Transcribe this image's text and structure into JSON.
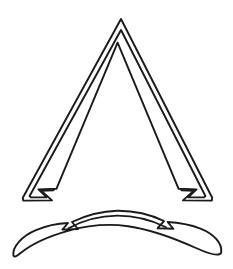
{
  "canvas": {
    "width": 233,
    "height": 269,
    "background_color": "#ffffff",
    "ink_color": "#1a1a1a",
    "stroke_width": 1.9
  },
  "artwork": {
    "title": "Line-art emblem: chevron with banner scroll",
    "style": "black outline on white, no fill",
    "element_count": 2
  },
  "shapes": {
    "chevron": {
      "label": "Double-outlined tall triangle with flared notched feet",
      "apex": {
        "x": 121,
        "y": 19
      },
      "left_foot": {
        "x": 31,
        "y": 200
      },
      "right_foot": {
        "x": 212,
        "y": 200
      },
      "band_thickness": 8,
      "outer_path": "M 121 19 L 212 198 L 211.5 200.5 L 183 200 L 194 190.5 L 182 190 L 117.5 36 L 53 190 L 41 190.5 L 51.5 200 L 23.5 200.5 L 23 198 Z",
      "outer_outline": "M 121.0 19.0 L 212.2 197.8 L 211.8 200.6 L 183.0 200.4 L 193.8 190.8 L 181.6 190.4 L 117.6 36.6 L 53.4 190.4 L 41.2 190.8 L 52.0 200.4 L 23.2 200.6 L 22.8 197.8 Z",
      "inner_outline": "M 121.0 30.0 L 205.4 196.0 L 204.0 197.4 L 188.2 197.2 L 196.6 189.4 L 178.6 188.8 L 117.6 42.6 L 56.4 188.8 L 38.4 189.4 L 46.8 197.2 L 31.0 197.4 L 29.6 196.0 Z"
    },
    "banner": {
      "label": "Curved ribbon scroll with pointed tails",
      "left_tip": {
        "x": 13,
        "y": 256
      },
      "right_tip": {
        "x": 221,
        "y": 253
      },
      "arc_crest": {
        "x": 117,
        "y": 211
      },
      "outer_path": "M 13.4 255.6 C 12.0 247.0 22.0 236.0 36.0 230.2 C 48.0 225.0 58.0 223.4 68.0 223.0 L 62.4 229.6 L 78.0 229.0 L 72.0 222.0 C 86.0 215.4 102.0 211.2 117.2 210.8 C 133.0 210.6 150.0 214.4 164.0 221.0 L 157.6 228.2 L 173.4 228.8 L 167.6 222.0 C 179.0 222.6 190.0 224.6 200.4 228.6 C 214.0 233.8 222.6 243.6 221.2 252.8 C 219.0 257.0 207.0 253.0 196.0 248.0 C 176.0 239.0 152.0 229.6 128.0 226.2 C 108.0 223.4 88.0 225.2 68.0 230.8 C 48.0 236.4 30.0 245.2 20.0 253.4 C 16.4 256.4 14.2 257.4 13.4 255.6 Z",
      "inner_arc_path": "M 68.4 228.4 C 84.0 219.6 100.6 215.8 117.2 215.6 C 134.0 215.6 150.4 219.4 166.0 227.2"
    }
  }
}
